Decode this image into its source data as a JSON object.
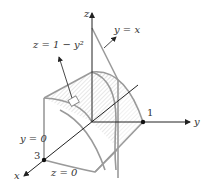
{
  "diagram": {
    "axes": {
      "x_label": "x",
      "y_label": "y",
      "z_label": "z"
    },
    "tick_labels": {
      "y_one": "1",
      "x_three": "3"
    },
    "annotations": {
      "surface": "z = 1 − y²",
      "plane_yx": "y = x",
      "plane_y0": "y = 0",
      "plane_z0": "z = 0"
    },
    "colors": {
      "axis": "#222222",
      "surface_edge": "#9a9a9a",
      "hatch": "#c8c8c8"
    }
  }
}
